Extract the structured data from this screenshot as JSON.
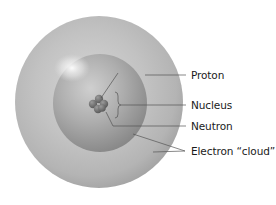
{
  "diagram": {
    "labels": [
      {
        "id": "proton",
        "text": "Proton",
        "x": 191,
        "y": 69
      },
      {
        "id": "nucleus",
        "text": "Nucleus",
        "x": 191,
        "y": 99
      },
      {
        "id": "neutron",
        "text": "Neutron",
        "x": 191,
        "y": 120
      },
      {
        "id": "electron-cloud",
        "text": "Electron “cloud”",
        "x": 191,
        "y": 145
      }
    ],
    "colors": {
      "outer_sphere_light": "#c9c9c9",
      "outer_sphere_dark": "#9d9d9d",
      "inner_sphere_light": "#bdbdbd",
      "inner_sphere_dark": "#878787",
      "highlight": "#f4f4f4",
      "nucleus": "#777777",
      "leader_line": "#555555",
      "text": "#1a1a1a"
    }
  }
}
